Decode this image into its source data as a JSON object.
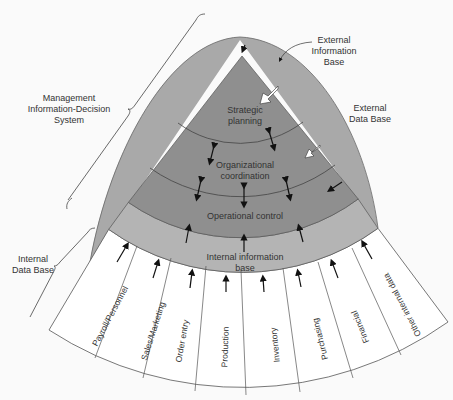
{
  "diagram": {
    "side_labels": {
      "midss": [
        "Management",
        "Information-Decision",
        "System"
      ],
      "internal_db": [
        "Internal",
        "Data Base"
      ],
      "external_info": [
        "External",
        "Information",
        "Base"
      ],
      "external_db": [
        "External",
        "Data Base"
      ]
    },
    "layers": [
      {
        "id": "strategic",
        "lines": [
          "Strategic",
          "planning"
        ]
      },
      {
        "id": "organizational",
        "lines": [
          "Organizational",
          "coordination"
        ]
      },
      {
        "id": "operational",
        "lines": [
          "Operational control"
        ]
      },
      {
        "id": "internal_info",
        "lines": [
          "Internal information",
          "base"
        ]
      }
    ],
    "data_sources": [
      "Payroll/Personnel",
      "Sales/Marketing",
      "Order entry",
      "Production",
      "Inventory",
      "Purchasing",
      "Financial",
      "Other internal data"
    ],
    "colors": {
      "external_dome": "#a9a9a9",
      "pyramid": "#8f8f8f",
      "internal_band": "#b4b4b4",
      "sources_band": "#ffffff",
      "lines": "#444444"
    }
  }
}
